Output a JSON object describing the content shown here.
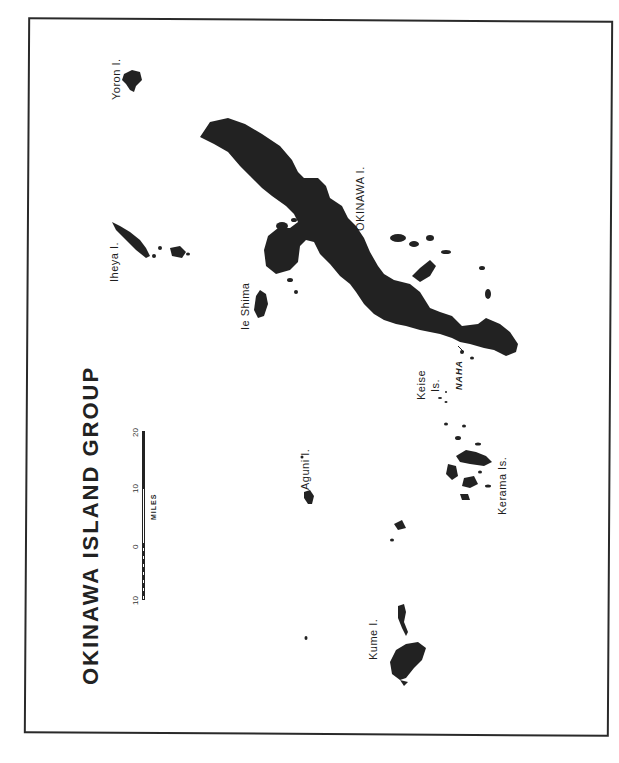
{
  "map": {
    "title": "OKINAWA ISLAND GROUP",
    "ink_color": "#222222",
    "paper_color": "#ffffff",
    "orientation": "rotated -90deg (north to the left)",
    "labels": {
      "okinawa": "OKINAWA I.",
      "yoron": "Yoron I.",
      "iheya": "Iheya I.",
      "ie_shima": "Ie Shima",
      "aguni": "Aguni I.",
      "kume": "Kume I.",
      "kerama": "Kerama Is.",
      "keise_line1": "Keise",
      "keise_line2": "Is.",
      "naha": "NAHA"
    },
    "scale": {
      "unit": "MILES",
      "ticks": [
        "10",
        "0",
        "10",
        "20"
      ]
    }
  }
}
